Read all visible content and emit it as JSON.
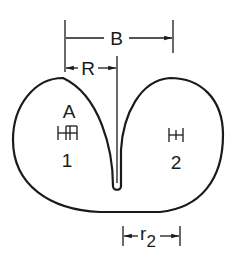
{
  "diagram": {
    "colors": {
      "stroke": "#1a1a1a",
      "background": "#ffffff"
    },
    "labels": {
      "B": "B",
      "R": "R",
      "A": "A",
      "point1": "1",
      "point2": "2",
      "r2_main": "r",
      "r2_sub": "2"
    },
    "dimensions": [
      {
        "name": "B",
        "from_x": 65,
        "to_x": 173,
        "y": 38
      },
      {
        "name": "R",
        "from_x": 67,
        "to_x": 117,
        "y": 68
      },
      {
        "name": "r2",
        "from_x": 123,
        "to_x": 180,
        "y": 236
      }
    ],
    "markers": [
      {
        "id": "1",
        "x": 69,
        "y": 133,
        "type": "double-bar"
      },
      {
        "id": "2",
        "x": 176,
        "y": 135,
        "type": "double-bar"
      }
    ]
  }
}
